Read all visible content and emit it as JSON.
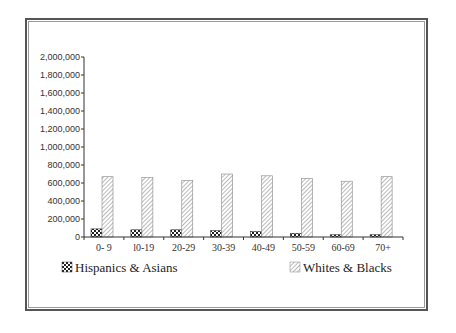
{
  "chart_data": {
    "type": "bar",
    "title": "",
    "xlabel": "",
    "ylabel": "",
    "categories": [
      "0- 9",
      "l0-19",
      "20-29",
      "30-39",
      "40-49",
      "50-59",
      "60-69",
      "70+"
    ],
    "series": [
      {
        "name": "Hispanics & Asians",
        "pattern": "checker",
        "values": [
          90000,
          80000,
          80000,
          70000,
          60000,
          40000,
          25000,
          25000
        ]
      },
      {
        "name": "Whites & Blacks",
        "pattern": "diagonal-hatch",
        "values": [
          670000,
          660000,
          630000,
          700000,
          680000,
          650000,
          620000,
          670000
        ]
      }
    ],
    "ylim": [
      0,
      2000000
    ],
    "yticks": [
      "0",
      "200,000",
      "400,000",
      "600,000",
      "800,000",
      "1,000,000",
      "1,200,000",
      "1,400,000",
      "1,600,000",
      "1,800,000",
      "2,000,000"
    ],
    "grid": false,
    "legend_position": "bottom"
  },
  "legend": {
    "item1": "Hispanics & Asians",
    "item2": "Whites & Blacks"
  },
  "colors": {
    "frame": "#555555",
    "axis": "#333333",
    "bar_fill": "#ffffff",
    "bar_pattern": "#555555"
  }
}
